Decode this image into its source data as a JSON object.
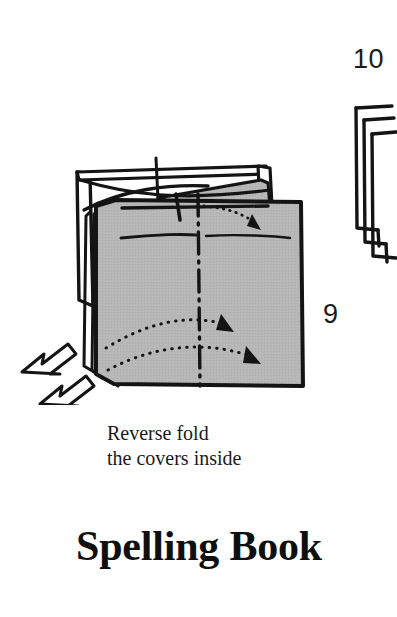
{
  "page": {
    "background_color": "#ffffff",
    "ink_color": "#1a1a1a",
    "paper_fill_color": "#b5b5b5"
  },
  "steps": [
    {
      "number": "9",
      "caption": "Reverse fold\nthe covers inside",
      "figure_name": "folded-book-front-view"
    },
    {
      "number": "10",
      "caption": "",
      "figure_name": "folded-book-edge-view-cropped"
    }
  ],
  "step_labels": {
    "nine": "9",
    "ten": "10"
  },
  "instruction": {
    "line1": "Reverse fold",
    "line2": "the covers inside",
    "full": "Reverse fold\nthe covers inside"
  },
  "title": {
    "text": "Spelling Book"
  },
  "diagram_annotations": {
    "action_arrows": "two-hollow-push-arrows-at-spine",
    "hidden_fold_arrows": "two-dotted-curved-arrows-with-solid-heads",
    "center_line": "dash-dot-vertical-fold-line",
    "wedge": "gray-wedge-flap-at-top-right"
  }
}
